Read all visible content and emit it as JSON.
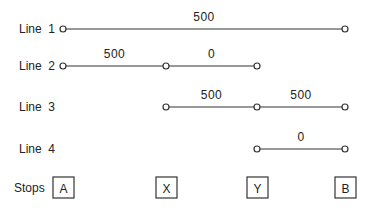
{
  "diagram": {
    "stops_label": "Stops",
    "stops": [
      "A",
      "X",
      "Y",
      "B"
    ],
    "lines": [
      {
        "label": "Line 1",
        "segments": [
          {
            "from": "A",
            "to": "B",
            "value": "500"
          }
        ]
      },
      {
        "label": "Line 2",
        "segments": [
          {
            "from": "A",
            "to": "X",
            "value": "500"
          },
          {
            "from": "X",
            "to": "Y",
            "value": "0"
          }
        ]
      },
      {
        "label": "Line 3",
        "segments": [
          {
            "from": "X",
            "to": "Y",
            "value": "500"
          },
          {
            "from": "Y",
            "to": "B",
            "value": "500"
          }
        ]
      },
      {
        "label": "Line 4",
        "segments": [
          {
            "from": "Y",
            "to": "B",
            "value": "0"
          }
        ]
      }
    ]
  }
}
